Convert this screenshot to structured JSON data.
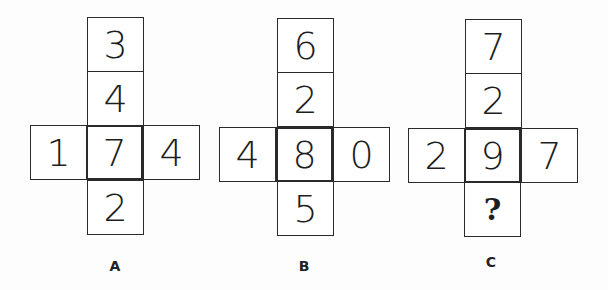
{
  "puzzle": {
    "figures": [
      {
        "label": "A",
        "top": "3",
        "upper": "4",
        "left": "1",
        "center": "7",
        "right": "4",
        "bottom": "2"
      },
      {
        "label": "B",
        "top": "6",
        "upper": "2",
        "left": "4",
        "center": "8",
        "right": "0",
        "bottom": "5"
      },
      {
        "label": "C",
        "top": "7",
        "upper": "2",
        "left": "2",
        "center": "9",
        "right": "7",
        "bottom": "?"
      }
    ]
  }
}
